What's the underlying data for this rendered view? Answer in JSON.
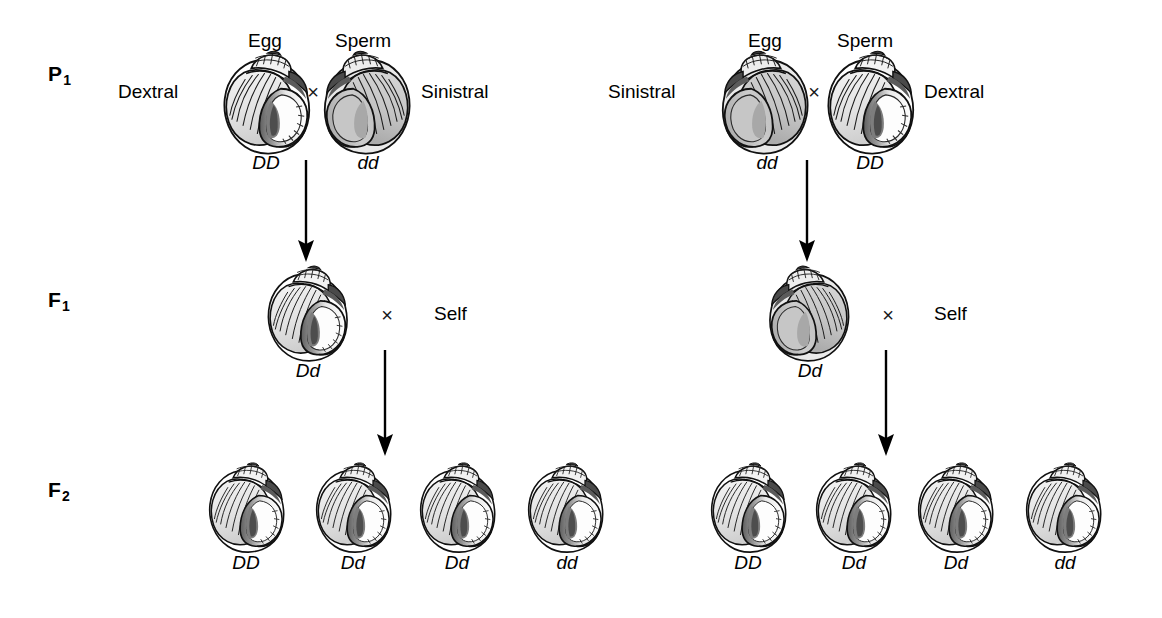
{
  "figure": {
    "background_color": "#ffffff",
    "ink_color": "#000000"
  },
  "generations": [
    {
      "id": "p1",
      "label": "P",
      "subscript": "1"
    },
    {
      "id": "f1",
      "label": "F",
      "subscript": "1"
    },
    {
      "id": "f2",
      "label": "F",
      "subscript": "2"
    }
  ],
  "gamete_labels": {
    "egg": "Egg",
    "sperm": "Sperm"
  },
  "phenotypes": {
    "dextral": "Dextral",
    "sinistral": "Sinistral"
  },
  "symbols": {
    "cross": "×",
    "self": "Self"
  },
  "genotypes": {
    "homozygous_dominant": "DD",
    "heterozygous": "Dd",
    "homozygous_recessive": "dd"
  },
  "crosses": [
    {
      "id": "left-cross",
      "p1": {
        "egg": {
          "gamete_label": "Egg",
          "phenotype": "Dextral",
          "phenotype_side": "left",
          "genotype": "DD",
          "coiling": "dextral"
        },
        "cross_symbol": "×",
        "sperm": {
          "gamete_label": "Sperm",
          "phenotype": "Sinistral",
          "phenotype_side": "right",
          "genotype": "dd",
          "coiling": "sinistral"
        }
      },
      "f1": {
        "genotype": "Dd",
        "coiling": "dextral",
        "cross_symbol": "×",
        "mate": "Self"
      },
      "f2": [
        {
          "genotype": "DD",
          "coiling": "dextral"
        },
        {
          "genotype": "Dd",
          "coiling": "dextral"
        },
        {
          "genotype": "Dd",
          "coiling": "dextral"
        },
        {
          "genotype": "dd",
          "coiling": "dextral"
        }
      ]
    },
    {
      "id": "right-cross",
      "p1": {
        "egg": {
          "gamete_label": "Egg",
          "phenotype": "Sinistral",
          "phenotype_side": "left",
          "genotype": "dd",
          "coiling": "sinistral"
        },
        "cross_symbol": "×",
        "sperm": {
          "gamete_label": "Sperm",
          "phenotype": "Dextral",
          "phenotype_side": "right",
          "genotype": "DD",
          "coiling": "dextral"
        }
      },
      "f1": {
        "genotype": "Dd",
        "coiling": "sinistral",
        "cross_symbol": "×",
        "mate": "Self"
      },
      "f2": [
        {
          "genotype": "DD",
          "coiling": "dextral"
        },
        {
          "genotype": "Dd",
          "coiling": "dextral"
        },
        {
          "genotype": "Dd",
          "coiling": "dextral"
        },
        {
          "genotype": "dd",
          "coiling": "dextral"
        }
      ]
    }
  ]
}
